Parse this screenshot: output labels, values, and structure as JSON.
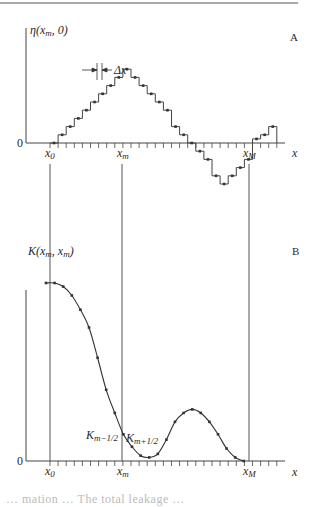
{
  "figure": {
    "panel_a": {
      "label": "A",
      "y_axis_label": "η(x_m, 0)",
      "y_axis_label_parts": {
        "main": "η(x",
        "sub": "m",
        "tail": ", 0)"
      },
      "zero_label": "0",
      "x_axis_label": "x",
      "delta_label": "Δx",
      "x_ticks": {
        "x0": "x",
        "x0_sub": "0",
        "xm": "x",
        "xm_sub": "m",
        "xM": "x",
        "xM_sub": "M"
      }
    },
    "panel_b": {
      "label": "B",
      "y_axis_label_parts": {
        "main": "K(x",
        "sub1": "m",
        "mid": ", x",
        "sub2": "m",
        "tail": ")"
      },
      "zero_label": "0",
      "x_axis_label": "x",
      "annot_left": {
        "main": "K",
        "sub": "m−1/2"
      },
      "annot_right": {
        "main": "K",
        "sub": "m+1/2"
      },
      "x_ticks": {
        "x0": "x",
        "x0_sub": "0",
        "xm": "x",
        "xm_sub": "m",
        "xM": "x",
        "xM_sub": "M"
      }
    },
    "caption_fragment": "… mation … The total leakage …"
  },
  "chart_data": [
    {
      "type": "line",
      "title": "A",
      "xlabel": "x",
      "ylabel": "η(x_m, 0)",
      "style": "step (piecewise constant, width Δx) with midpoint markers",
      "x_labels": [
        "x_0",
        "x_m",
        "x_M"
      ],
      "x_grid_points": 28,
      "values": [
        0,
        1,
        2,
        3,
        4,
        5,
        6,
        7,
        8,
        9,
        8,
        7,
        6,
        5,
        4,
        2,
        1,
        0,
        -1,
        -2,
        -4,
        -5,
        -4,
        -3,
        -2,
        0.5,
        1,
        2
      ],
      "annotations": [
        "Δx (step width)"
      ]
    },
    {
      "type": "line",
      "title": "B",
      "xlabel": "x",
      "ylabel": "K(x_m, x_m)",
      "style": "smooth curve with markers",
      "x_labels": [
        "x_0",
        "x_m",
        "x_M"
      ],
      "points": [
        [
          0,
          1.0
        ],
        [
          1,
          1.0
        ],
        [
          2,
          0.98
        ],
        [
          3,
          0.93
        ],
        [
          4,
          0.85
        ],
        [
          5,
          0.75
        ],
        [
          6,
          0.58
        ],
        [
          7,
          0.4
        ],
        [
          8,
          0.27
        ],
        [
          9,
          0.15
        ],
        [
          10,
          0.08
        ],
        [
          11,
          0.03
        ],
        [
          12,
          0.02
        ],
        [
          13,
          0.04
        ],
        [
          14,
          0.12
        ],
        [
          15,
          0.22
        ],
        [
          16,
          0.27
        ],
        [
          17,
          0.29
        ],
        [
          18,
          0.27
        ],
        [
          19,
          0.22
        ],
        [
          20,
          0.15
        ],
        [
          21,
          0.07
        ],
        [
          22,
          0.02
        ],
        [
          23,
          0.0
        ]
      ],
      "annotations": [
        "K_{m−1/2}",
        "K_{m+1/2}"
      ]
    }
  ]
}
